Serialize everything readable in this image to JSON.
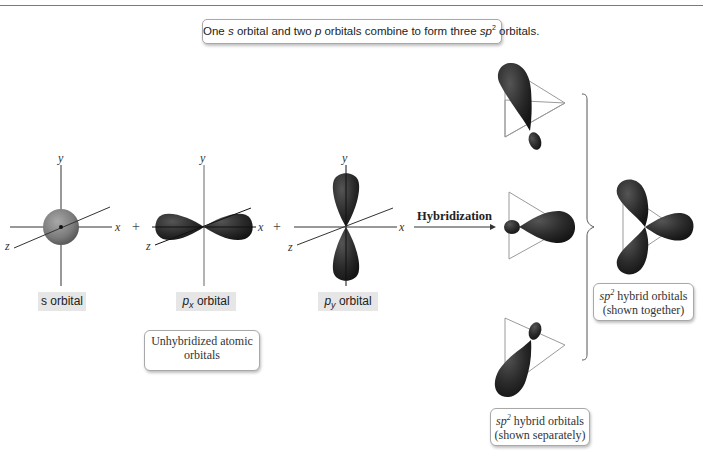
{
  "title": {
    "prefix": "One ",
    "s": "s",
    "middle": " orbital and two ",
    "p": "p",
    "middle2": " orbitals combine to form three ",
    "sp": "sp",
    "sup": "2",
    "suffix": " orbitals."
  },
  "axes": {
    "x": "x",
    "y": "y",
    "z": "z"
  },
  "operators": {
    "plus": "+"
  },
  "arrow_label": "Hybridization",
  "orbital_labels": {
    "s": {
      "italic": "s",
      "text": " orbital"
    },
    "px": {
      "italic": "p",
      "sub": "x",
      "text": " orbital"
    },
    "py": {
      "italic": "p",
      "sub": "y",
      "text": " orbital"
    }
  },
  "captions": {
    "unhybridized": {
      "line1": "Unhybridized atomic",
      "line2": "orbitals"
    },
    "separately": {
      "italic": "sp",
      "sup": "2",
      "line1_rest": " hybrid orbitals",
      "line2": "(shown separately)"
    },
    "together": {
      "italic": "sp",
      "sup": "2",
      "line1_rest": " hybrid orbitals",
      "line2": "(shown together)"
    }
  },
  "colors": {
    "lobe": "#2a2a2a",
    "sphere": "#7d7d7d",
    "axis": "#333333",
    "triangle": "#9a9a9a",
    "label_bg": "#e6e6e6"
  }
}
